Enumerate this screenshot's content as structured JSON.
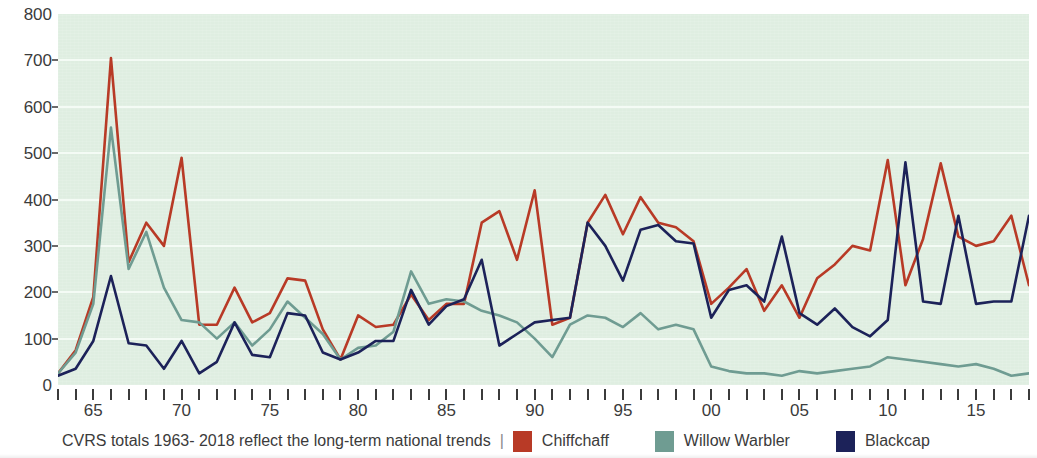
{
  "caption": {
    "text": "CVRS totals 1963- 2018 reflect the long-term national trends",
    "separator": "|"
  },
  "legend": {
    "position": "bottom",
    "items": [
      {
        "label": "Chiffchaff",
        "color": "#b83a26",
        "icon": "color-swatch"
      },
      {
        "label": "Willow Warbler",
        "color": "#6f9c92",
        "icon": "color-swatch"
      },
      {
        "label": "Blackcap",
        "color": "#1c2259",
        "icon": "color-swatch"
      }
    ]
  },
  "axes": {
    "y_ticks": [
      0,
      100,
      200,
      300,
      400,
      500,
      600,
      700,
      800
    ],
    "x_tick_labels": [
      "65",
      "70",
      "75",
      "80",
      "85",
      "90",
      "95",
      "00",
      "05",
      "10",
      "15"
    ],
    "x_tick_label_years": [
      1965,
      1970,
      1975,
      1980,
      1985,
      1990,
      1995,
      2000,
      2005,
      2010,
      2015
    ]
  },
  "colors": {
    "plot_background": "#dfeee1",
    "gridline": "#f4fbf5",
    "axis_text": "#3b3b3b",
    "page_background": "#ffffff"
  },
  "chart_data": {
    "type": "line",
    "title": "",
    "subtitle": "",
    "xlabel": "",
    "ylabel": "",
    "xlim": [
      1963,
      2018
    ],
    "ylim": [
      0,
      800
    ],
    "grid": true,
    "legend_position": "bottom",
    "x": [
      1963,
      1964,
      1965,
      1966,
      1967,
      1968,
      1969,
      1970,
      1971,
      1972,
      1973,
      1974,
      1975,
      1976,
      1977,
      1978,
      1979,
      1980,
      1981,
      1982,
      1983,
      1984,
      1985,
      1986,
      1987,
      1988,
      1989,
      1990,
      1991,
      1992,
      1993,
      1994,
      1995,
      1996,
      1997,
      1998,
      1999,
      2000,
      2001,
      2002,
      2003,
      2004,
      2005,
      2006,
      2007,
      2008,
      2009,
      2010,
      2011,
      2012,
      2013,
      2014,
      2015,
      2016,
      2017,
      2018
    ],
    "series": [
      {
        "name": "Chiffchaff",
        "color": "#b83a26",
        "values": [
          25,
          75,
          190,
          705,
          265,
          350,
          300,
          490,
          130,
          130,
          210,
          135,
          155,
          230,
          225,
          120,
          55,
          150,
          125,
          130,
          195,
          140,
          175,
          175,
          350,
          375,
          270,
          420,
          130,
          145,
          350,
          410,
          325,
          405,
          350,
          340,
          310,
          175,
          210,
          250,
          160,
          215,
          145,
          230,
          260,
          300,
          290,
          485,
          215,
          315,
          478,
          320,
          300,
          310,
          365,
          215
        ]
      },
      {
        "name": "Willow Warbler",
        "color": "#6f9c92",
        "values": [
          25,
          70,
          175,
          555,
          250,
          330,
          210,
          140,
          135,
          100,
          135,
          85,
          120,
          180,
          145,
          110,
          55,
          80,
          85,
          115,
          245,
          175,
          185,
          180,
          160,
          150,
          135,
          100,
          60,
          130,
          150,
          145,
          125,
          155,
          120,
          130,
          120,
          40,
          30,
          25,
          25,
          20,
          30,
          25,
          30,
          35,
          40,
          60,
          55,
          50,
          45,
          40,
          45,
          35,
          20,
          25
        ]
      },
      {
        "name": "Blackcap",
        "color": "#1c2259",
        "values": [
          20,
          35,
          95,
          235,
          90,
          85,
          35,
          95,
          25,
          50,
          135,
          65,
          60,
          155,
          150,
          70,
          55,
          70,
          95,
          95,
          205,
          130,
          170,
          185,
          270,
          85,
          110,
          135,
          140,
          145,
          350,
          300,
          225,
          335,
          345,
          310,
          305,
          145,
          205,
          215,
          180,
          320,
          155,
          130,
          165,
          125,
          105,
          140,
          480,
          180,
          175,
          365,
          175,
          180,
          180,
          365
        ]
      }
    ]
  }
}
